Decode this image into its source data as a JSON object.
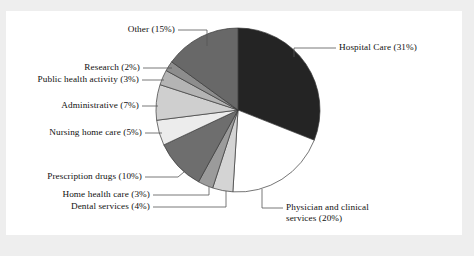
{
  "figure": {
    "background_color": "#eeeeee",
    "panel_color": "#ffffff",
    "text_color": "#111111"
  },
  "chart_data": {
    "type": "pie",
    "title": "",
    "subtitle": "",
    "xlabel": "",
    "ylabel": "",
    "legend_position": "none",
    "grid": false,
    "units": "percent",
    "start_angle_deg": 90,
    "direction": "clockwise",
    "center": {
      "x": 238,
      "y": 110
    },
    "radius": 82,
    "categories": [
      "Hospital Care",
      "Physician and clinical services",
      "Dental services",
      "Home health care",
      "Prescription drugs",
      "Nursing home care",
      "Administrative",
      "Public health activity",
      "Research",
      "Other"
    ],
    "values": [
      31,
      20,
      4,
      3,
      10,
      5,
      7,
      3,
      2,
      15
    ],
    "colors": [
      "#242424",
      "#ffffff",
      "#d4d4d4",
      "#9b9b9b",
      "#6e6e6e",
      "#ececec",
      "#cfcfcf",
      "#b4b4b4",
      "#8d8d8d",
      "#686868"
    ],
    "slices": [
      {
        "label": "Hospital Care",
        "value": 31,
        "color": "#242424",
        "label_text": "Hospital Care (31%)"
      },
      {
        "label": "Physician and clinical services",
        "value": 20,
        "color": "#ffffff",
        "label_text": "Physician and clinical services (20%)"
      },
      {
        "label": "Dental services",
        "value": 4,
        "color": "#d4d4d4",
        "label_text": "Dental services (4%)"
      },
      {
        "label": "Home health care",
        "value": 3,
        "color": "#9b9b9b",
        "label_text": "Home health care (3%)"
      },
      {
        "label": "Prescription drugs",
        "value": 10,
        "color": "#6e6e6e",
        "label_text": "Prescription drugs (10%)"
      },
      {
        "label": "Nursing home care",
        "value": 5,
        "color": "#ececec",
        "label_text": "Nursing home care (5%)"
      },
      {
        "label": "Administrative",
        "value": 7,
        "color": "#cfcfcf",
        "label_text": "Administrative (7%)"
      },
      {
        "label": "Public health activity",
        "value": 3,
        "color": "#b4b4b4",
        "label_text": "Public health activity (3%)"
      },
      {
        "label": "Research",
        "value": 2,
        "color": "#8d8d8d",
        "label_text": "Research (2%)"
      },
      {
        "label": "Other",
        "value": 15,
        "color": "#686868",
        "label_text": "Other (15%)"
      }
    ]
  },
  "labels": {
    "hospital_care": "Hospital Care (31%)",
    "physician_line1": "Physician and clinical",
    "physician_line2": "services (20%)",
    "dental_services": "Dental services (4%)",
    "home_health_care": "Home health care (3%)",
    "prescription_drugs": "Prescription drugs (10%)",
    "nursing_home_care": "Nursing home care (5%)",
    "administrative": "Administrative (7%)",
    "public_health_activity": "Public health activity (3%)",
    "research": "Research (2%)",
    "other": "Other (15%)"
  }
}
